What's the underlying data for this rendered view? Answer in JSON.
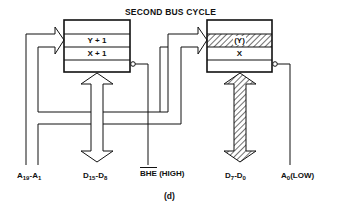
{
  "diagram": {
    "title": "SECOND BUS CYCLE",
    "caption": "(d)",
    "left_memory_bank": {
      "rows": [
        "",
        "Y + 1",
        "X + 1",
        ""
      ],
      "highlighted_row": null
    },
    "right_memory_bank": {
      "rows": [
        "",
        "(Y)",
        "X",
        ""
      ],
      "highlighted_row": "(Y)"
    },
    "signals": {
      "address_bus": {
        "name": "A",
        "from_sub": "19",
        "to_name": "A",
        "to_sub": "1"
      },
      "high_data_bus": {
        "name": "D",
        "from_sub": "15",
        "to_name": "D",
        "to_sub": "8"
      },
      "bhe": {
        "name": "BHE",
        "state": "(HIGH)"
      },
      "low_data_bus": {
        "name": "D",
        "from_sub": "7",
        "to_name": "D",
        "to_sub": "0",
        "hatched": true
      },
      "a0": {
        "name": "A",
        "sub": "0",
        "state": "(LOW)"
      }
    },
    "colors": {
      "line": "#111111",
      "background": "#ffffff"
    }
  }
}
